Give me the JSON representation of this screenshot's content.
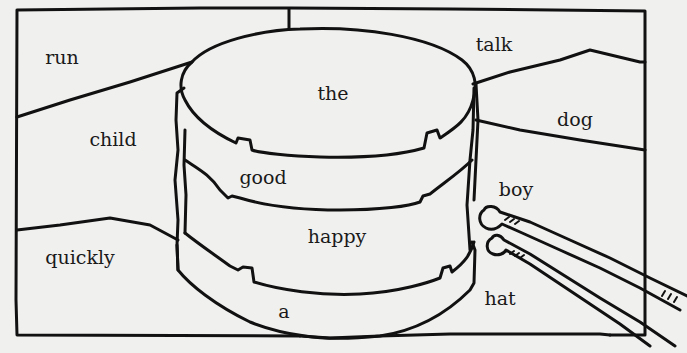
{
  "worksheet": {
    "description": "Word sorting puzzle: cake with layers and tongs",
    "ink_color": "#111111",
    "paper_color": "#f0f0ef",
    "words": [
      {
        "id": "run",
        "text": "run",
        "x": 62,
        "y": 57
      },
      {
        "id": "talk",
        "text": "talk",
        "x": 494,
        "y": 44
      },
      {
        "id": "the",
        "text": "the",
        "x": 333,
        "y": 93
      },
      {
        "id": "child",
        "text": "child",
        "x": 113,
        "y": 139
      },
      {
        "id": "dog",
        "text": "dog",
        "x": 575,
        "y": 119
      },
      {
        "id": "good",
        "text": "good",
        "x": 263,
        "y": 177
      },
      {
        "id": "boy",
        "text": "boy",
        "x": 516,
        "y": 189
      },
      {
        "id": "happy",
        "text": "happy",
        "x": 337,
        "y": 236
      },
      {
        "id": "quickly",
        "text": "quickly",
        "x": 80,
        "y": 257
      },
      {
        "id": "hat",
        "text": "hat",
        "x": 500,
        "y": 298
      },
      {
        "id": "a",
        "text": "a",
        "x": 284,
        "y": 311
      }
    ]
  }
}
